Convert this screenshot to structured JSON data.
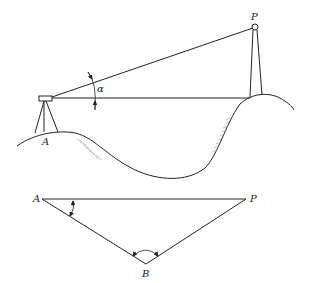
{
  "diagram": {
    "type": "surveying-elevation-and-plan",
    "top_view": {
      "description": "Elevation: instrument on tripod at station A on a hill, sighting target on tower P across a valley",
      "labels": {
        "instrument_station": "A",
        "target_point": "P",
        "vertical_angle": "α"
      }
    },
    "bottom_view": {
      "description": "Plan: triangle A-P-B with measured angles at A and B",
      "labels": {
        "vertex_a": "A",
        "vertex_p": "P",
        "vertex_b": "B"
      }
    }
  }
}
